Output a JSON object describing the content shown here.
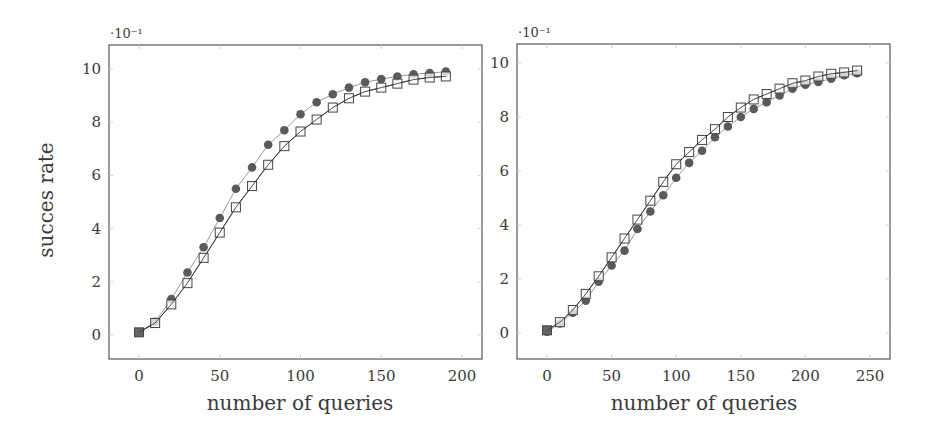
{
  "figure": {
    "ylabel": "succes rate",
    "colors": {
      "frame": "#555555",
      "circle_fill": "#5a5a5a",
      "circle_line": "#9a9a9a",
      "square_stroke": "#444444",
      "square_fill": "#ffffff",
      "square_line": "#333333",
      "grid_tick": "#cccccc"
    }
  },
  "chart_data": [
    {
      "type": "line",
      "title": "",
      "xlabel": "number of queries",
      "ylabel": "succes rate",
      "y_scale_label": "·10⁻¹",
      "xlim": [
        -18,
        212
      ],
      "ylim": [
        -0.9,
        10.9
      ],
      "xticks": [
        0,
        50,
        100,
        150,
        200
      ],
      "yticks": [
        0,
        2,
        4,
        6,
        8,
        10
      ],
      "grid": false,
      "legend": null,
      "x": [
        0,
        10,
        20,
        30,
        40,
        50,
        60,
        70,
        80,
        90,
        100,
        110,
        120,
        130,
        140,
        150,
        160,
        170,
        180,
        190
      ],
      "series": [
        {
          "name": "filled-circle",
          "marker": "circle",
          "values": [
            0.1,
            0.5,
            1.35,
            2.35,
            3.3,
            4.4,
            5.5,
            6.3,
            7.15,
            7.7,
            8.3,
            8.75,
            9.05,
            9.3,
            9.5,
            9.62,
            9.72,
            9.8,
            9.85,
            9.9
          ]
        },
        {
          "name": "open-square",
          "marker": "square",
          "values": [
            0.1,
            0.45,
            1.15,
            1.95,
            2.9,
            3.85,
            4.8,
            5.6,
            6.4,
            7.1,
            7.65,
            8.1,
            8.55,
            8.9,
            9.15,
            9.3,
            9.45,
            9.6,
            9.68,
            9.72
          ]
        }
      ]
    },
    {
      "type": "line",
      "title": "",
      "xlabel": "number of queries",
      "ylabel": "",
      "y_scale_label": "·10⁻¹",
      "xlim": [
        -23,
        265
      ],
      "ylim": [
        -0.9,
        10.9
      ],
      "xticks": [
        0,
        50,
        100,
        150,
        200,
        250
      ],
      "yticks": [
        0,
        2,
        4,
        6,
        8,
        10
      ],
      "grid": false,
      "legend": null,
      "x": [
        0,
        10,
        20,
        30,
        40,
        50,
        60,
        70,
        80,
        90,
        100,
        110,
        120,
        130,
        140,
        150,
        160,
        170,
        180,
        190,
        200,
        210,
        220,
        230,
        240
      ],
      "series": [
        {
          "name": "filled-circle",
          "marker": "circle",
          "values": [
            0.05,
            0.35,
            0.75,
            1.2,
            1.9,
            2.5,
            3.05,
            3.85,
            4.5,
            5.1,
            5.75,
            6.3,
            6.75,
            7.25,
            7.65,
            8.0,
            8.3,
            8.55,
            8.8,
            9.05,
            9.2,
            9.3,
            9.42,
            9.55,
            9.62
          ]
        },
        {
          "name": "open-square",
          "marker": "square",
          "values": [
            0.1,
            0.4,
            0.85,
            1.45,
            2.1,
            2.8,
            3.5,
            4.2,
            4.9,
            5.6,
            6.25,
            6.7,
            7.15,
            7.55,
            8.0,
            8.35,
            8.65,
            8.85,
            9.05,
            9.25,
            9.35,
            9.5,
            9.6,
            9.65,
            9.72
          ]
        }
      ]
    }
  ],
  "layout": {
    "panels": [
      {
        "frame": {
          "x": 109,
          "y": 45,
          "w": 373,
          "h": 314
        },
        "x0px": 139,
        "x1px": 462,
        "x1val": 200,
        "y0px": 335,
        "y1px": 69,
        "y1val": 10,
        "exp_pos": [
          110,
          38
        ],
        "xlabel_pos": [
          300,
          410
        ],
        "ylabel_pos": [
          46,
          200
        ]
      },
      {
        "frame": {
          "x": 517,
          "y": 44,
          "w": 373,
          "h": 315
        },
        "x0px": 547,
        "x1px": 870,
        "x1val": 250,
        "y0px": 333,
        "y1px": 63,
        "y1val": 10,
        "exp_pos": [
          518,
          37
        ],
        "xlabel_pos": [
          704,
          410
        ],
        "ylabel_pos": null
      }
    ]
  }
}
